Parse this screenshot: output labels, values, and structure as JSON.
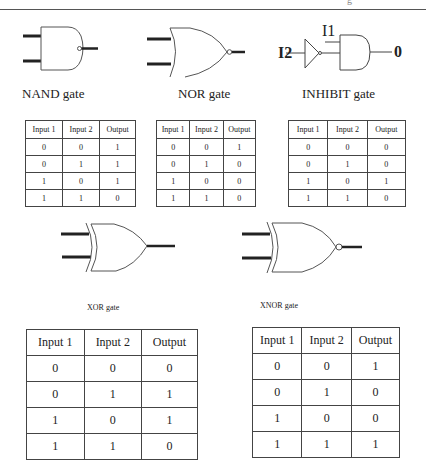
{
  "header": {
    "fragment": "g"
  },
  "gates": {
    "nand": {
      "label": "NAND gate",
      "icon": "nand-gate-icon"
    },
    "nor": {
      "label": "NOR gate",
      "icon": "nor-gate-icon"
    },
    "inhibit": {
      "label": "INHIBIT gate",
      "icon": "inhibit-gate-icon",
      "input1": "I1",
      "input2": "I2",
      "output": "0"
    },
    "xor": {
      "label": "XOR gate",
      "icon": "xor-gate-icon"
    },
    "xnor": {
      "label": "XNOR gate",
      "icon": "xnor-gate-icon"
    }
  },
  "tables": {
    "nand": {
      "headers": [
        "Input 1",
        "Input 2",
        "Output"
      ],
      "rows": [
        [
          "0",
          "0",
          "1"
        ],
        [
          "0",
          "1",
          "1"
        ],
        [
          "1",
          "0",
          "1"
        ],
        [
          "1",
          "1",
          "0"
        ]
      ]
    },
    "nor": {
      "headers": [
        "Input 1",
        "Input 2",
        "Output"
      ],
      "rows": [
        [
          "0",
          "0",
          "1"
        ],
        [
          "0",
          "1",
          "0"
        ],
        [
          "1",
          "0",
          "0"
        ],
        [
          "1",
          "1",
          "0"
        ]
      ]
    },
    "inhibit": {
      "headers": [
        "Input 1",
        "Input 2",
        "Output"
      ],
      "rows": [
        [
          "0",
          "0",
          "0"
        ],
        [
          "0",
          "1",
          "0"
        ],
        [
          "1",
          "0",
          "1"
        ],
        [
          "1",
          "1",
          "0"
        ]
      ]
    },
    "xor": {
      "headers": [
        "Input 1",
        "Input 2",
        "Output"
      ],
      "rows": [
        [
          "0",
          "0",
          "0"
        ],
        [
          "0",
          "1",
          "1"
        ],
        [
          "1",
          "0",
          "1"
        ],
        [
          "1",
          "1",
          "0"
        ]
      ]
    },
    "xnor": {
      "headers": [
        "Input 1",
        "Input 2",
        "Output"
      ],
      "rows": [
        [
          "0",
          "0",
          "1"
        ],
        [
          "0",
          "1",
          "0"
        ],
        [
          "1",
          "0",
          "0"
        ],
        [
          "1",
          "1",
          "1"
        ]
      ]
    }
  }
}
